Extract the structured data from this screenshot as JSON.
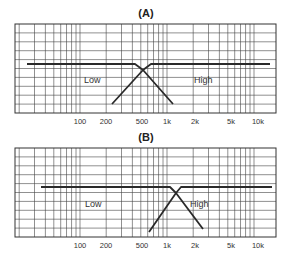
{
  "chart_data": [
    {
      "type": "line",
      "title": "(A)",
      "xlabel": "",
      "ylabel": "",
      "x_scale": "log",
      "x_ticks": [
        "100",
        "200",
        "500",
        "1k",
        "2k",
        "5k",
        "10k"
      ],
      "x_tick_values": [
        100,
        200,
        500,
        1000,
        2000,
        5000,
        10000
      ],
      "xlim": [
        18,
        18000
      ],
      "grid": true,
      "crossover_hz": 500,
      "series": [
        {
          "name": "Low",
          "points": [
            [
              25,
              0
            ],
            [
              420,
              0
            ],
            [
              500,
              -0.5
            ],
            [
              1200,
              -3.5
            ]
          ]
        },
        {
          "name": "High",
          "points": [
            [
              230,
              -3.5
            ],
            [
              600,
              0
            ],
            [
              15000,
              0
            ]
          ]
        }
      ],
      "annotations": [
        "Low",
        "High"
      ]
    },
    {
      "type": "line",
      "title": "(B)",
      "xlabel": "",
      "ylabel": "",
      "x_scale": "log",
      "x_ticks": [
        "100",
        "200",
        "500",
        "1k",
        "2k",
        "5k",
        "10k"
      ],
      "x_tick_values": [
        100,
        200,
        500,
        1000,
        2000,
        5000,
        10000
      ],
      "xlim": [
        18,
        18000
      ],
      "grid": true,
      "crossover_hz": 1200,
      "series": [
        {
          "name": "Low",
          "points": [
            [
              35,
              0
            ],
            [
              1050,
              0
            ],
            [
              1200,
              -0.5
            ],
            [
              2400,
              -3.5
            ]
          ]
        },
        {
          "name": "High",
          "points": [
            [
              600,
              -3.5
            ],
            [
              1400,
              0
            ],
            [
              16000,
              0
            ]
          ]
        }
      ],
      "annotations": [
        "Low",
        "High"
      ]
    }
  ],
  "charts": [
    {
      "title": "(A)",
      "low_label": "Low",
      "high_label": "High",
      "ticks": [
        "100",
        "200",
        "500",
        "1k",
        "2k",
        "5k",
        "10k"
      ]
    },
    {
      "title": "(B)",
      "low_label": "Low",
      "high_label": "High",
      "ticks": [
        "100",
        "200",
        "500",
        "1k",
        "2k",
        "5k",
        "10k"
      ]
    }
  ]
}
